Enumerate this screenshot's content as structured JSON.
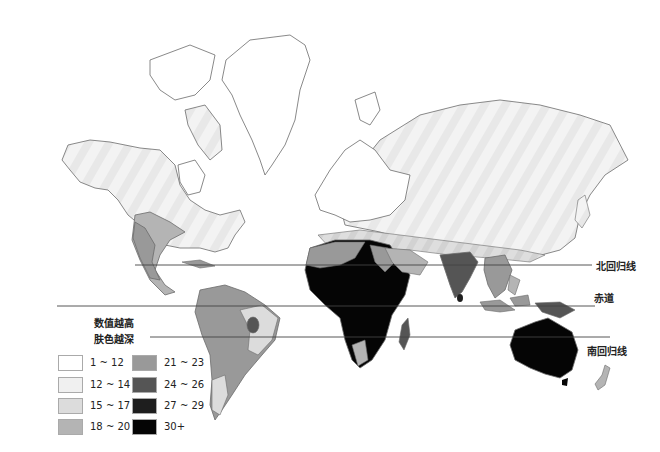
{
  "map": {
    "title": "世界肤色分布图 (皮肤颜色深浅)",
    "latitude_lines": [
      {
        "id": "tropic-of-cancer",
        "label": "北回归线",
        "y": 265,
        "x_start": 135,
        "x_end": 592
      },
      {
        "id": "equator",
        "label": "赤道",
        "y": 306,
        "x_start": 57,
        "x_end": 595
      },
      {
        "id": "tropic-of-capricorn",
        "label": "南回归线",
        "y": 337,
        "x_start": 150,
        "x_end": 610
      }
    ],
    "legend": {
      "title_line1": "数值越高",
      "title_line2": "肤色越深",
      "items": [
        {
          "label": "1 ~ 12",
          "color": "#ffffff"
        },
        {
          "label": "12 ~ 14",
          "color": "#f0f0f0"
        },
        {
          "label": "15 ~ 17",
          "color": "#dcdcdc"
        },
        {
          "label": "18 ~ 20",
          "color": "#b4b4b4"
        },
        {
          "label": "21 ~ 23",
          "color": "#999999"
        },
        {
          "label": "24 ~ 26",
          "color": "#555555"
        },
        {
          "label": "27 ~ 29",
          "color": "#1e1e1e"
        },
        {
          "label": "30+",
          "color": "#050505"
        }
      ]
    },
    "colors": {
      "outline": "#6b6b6b",
      "line": "#444444"
    }
  }
}
